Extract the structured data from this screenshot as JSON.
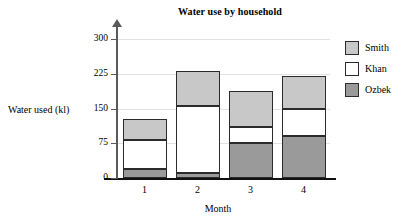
{
  "chart_data": {
    "type": "bar",
    "subtype": "stacked-bar",
    "title": "Water use by household",
    "xlabel": "Month",
    "ylabel": "Water used (kl)",
    "categories": [
      "1",
      "2",
      "3",
      "4"
    ],
    "ytick_labels": [
      "0",
      "75",
      "150",
      "225",
      "300"
    ],
    "ytick_values": [
      0,
      75,
      150,
      225,
      300
    ],
    "ylim": [
      0,
      300
    ],
    "grid": true,
    "grid_axis": "y",
    "legend_position": "right",
    "series": [
      {
        "name": "Ozbek",
        "color": "#9a9a9a",
        "values": [
          20,
          10,
          75,
          90
        ]
      },
      {
        "name": "Khan",
        "color": "#ffffff",
        "values": [
          62,
          145,
          35,
          58
        ]
      },
      {
        "name": "Smith",
        "color": "#c8c8c8",
        "values": [
          46,
          75,
          77,
          72
        ]
      }
    ],
    "totals": [
      128,
      230,
      187,
      220
    ],
    "stack_order_bottom_to_top": [
      "Ozbek",
      "Khan",
      "Smith"
    ]
  },
  "legend": {
    "items": [
      {
        "label": "Smith",
        "color": "#c8c8c8"
      },
      {
        "label": "Khan",
        "color": "#ffffff"
      },
      {
        "label": "Ozbek",
        "color": "#9a9a9a"
      }
    ]
  }
}
